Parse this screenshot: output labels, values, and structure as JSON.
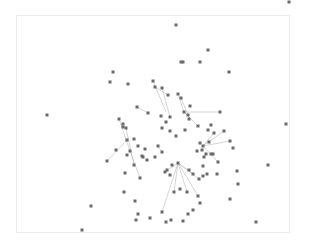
{
  "diagram": {
    "type": "network-graph",
    "frame": {
      "x": 16,
      "y": 15,
      "width": 273,
      "height": 217,
      "stroke": "#ececec"
    },
    "node_color": "#6a6a6a",
    "edge_color": "#b9b9b9",
    "node_size": 3,
    "nodes": [
      [
        176,
        25
      ],
      [
        208,
        50
      ],
      [
        289,
        2
      ],
      [
        200,
        62
      ],
      [
        229,
        72
      ],
      [
        181,
        62
      ],
      [
        183,
        62
      ],
      [
        113,
        72
      ],
      [
        110,
        82
      ],
      [
        128,
        84
      ],
      [
        220,
        112
      ],
      [
        47,
        115
      ],
      [
        286,
        124
      ],
      [
        137,
        107
      ],
      [
        153,
        81
      ],
      [
        155,
        87
      ],
      [
        162,
        88
      ],
      [
        168,
        95
      ],
      [
        178,
        94
      ],
      [
        181,
        98
      ],
      [
        190,
        106
      ],
      [
        148,
        113
      ],
      [
        161,
        116
      ],
      [
        166,
        122
      ],
      [
        189,
        119
      ],
      [
        184,
        112
      ],
      [
        170,
        117
      ],
      [
        188,
        115
      ],
      [
        119,
        119
      ],
      [
        123,
        127
      ],
      [
        126,
        128
      ],
      [
        127,
        140
      ],
      [
        130,
        151
      ],
      [
        134,
        139
      ],
      [
        127,
        155
      ],
      [
        123,
        124
      ],
      [
        116,
        150
      ],
      [
        107,
        161
      ],
      [
        125,
        173
      ],
      [
        142,
        156
      ],
      [
        138,
        146
      ],
      [
        145,
        149
      ],
      [
        143,
        157
      ],
      [
        134,
        165
      ],
      [
        147,
        160
      ],
      [
        155,
        157
      ],
      [
        162,
        152
      ],
      [
        158,
        146
      ],
      [
        162,
        128
      ],
      [
        170,
        131
      ],
      [
        176,
        136
      ],
      [
        185,
        130
      ],
      [
        198,
        126
      ],
      [
        208,
        130
      ],
      [
        211,
        125
      ],
      [
        214,
        133
      ],
      [
        224,
        131
      ],
      [
        230,
        141
      ],
      [
        233,
        148
      ],
      [
        209,
        142
      ],
      [
        200,
        143
      ],
      [
        203,
        146
      ],
      [
        202,
        150
      ],
      [
        206,
        154
      ],
      [
        211,
        154
      ],
      [
        213,
        154
      ],
      [
        204,
        157
      ],
      [
        197,
        151
      ],
      [
        218,
        162
      ],
      [
        203,
        166
      ],
      [
        207,
        174
      ],
      [
        203,
        176
      ],
      [
        178,
        163
      ],
      [
        172,
        165
      ],
      [
        167,
        170
      ],
      [
        165,
        172
      ],
      [
        170,
        175
      ],
      [
        189,
        170
      ],
      [
        193,
        174
      ],
      [
        199,
        179
      ],
      [
        198,
        196
      ],
      [
        174,
        192
      ],
      [
        187,
        192
      ],
      [
        200,
        203
      ],
      [
        193,
        210
      ],
      [
        188,
        214
      ],
      [
        183,
        221
      ],
      [
        217,
        174
      ],
      [
        237,
        171
      ],
      [
        238,
        184
      ],
      [
        230,
        199
      ],
      [
        268,
        165
      ],
      [
        256,
        222
      ],
      [
        135,
        201
      ],
      [
        138,
        214
      ],
      [
        136,
        220
      ],
      [
        150,
        218
      ],
      [
        162,
        212
      ],
      [
        166,
        222
      ],
      [
        171,
        220
      ],
      [
        180,
        189
      ],
      [
        140,
        178
      ],
      [
        124,
        192
      ],
      [
        91,
        206
      ],
      [
        82,
        230
      ]
    ],
    "edges": [
      [
        [
          153,
          81
        ],
        [
          166,
          112
        ]
      ],
      [
        [
          155,
          87
        ],
        [
          168,
          95
        ]
      ],
      [
        [
          162,
          88
        ],
        [
          170,
          117
        ]
      ],
      [
        [
          178,
          94
        ],
        [
          184,
          112
        ]
      ],
      [
        [
          181,
          98
        ],
        [
          188,
          115
        ]
      ],
      [
        [
          184,
          112
        ],
        [
          220,
          112
        ]
      ],
      [
        [
          184,
          112
        ],
        [
          198,
          126
        ]
      ],
      [
        [
          137,
          107
        ],
        [
          148,
          113
        ]
      ],
      [
        [
          119,
          119
        ],
        [
          130,
          151
        ]
      ],
      [
        [
          126,
          128
        ],
        [
          134,
          165
        ]
      ],
      [
        [
          127,
          140
        ],
        [
          107,
          161
        ]
      ],
      [
        [
          130,
          151
        ],
        [
          140,
          178
        ]
      ],
      [
        [
          203,
          146
        ],
        [
          230,
          141
        ]
      ],
      [
        [
          203,
          146
        ],
        [
          224,
          131
        ]
      ],
      [
        [
          203,
          146
        ],
        [
          214,
          133
        ]
      ],
      [
        [
          203,
          146
        ],
        [
          218,
          162
        ]
      ],
      [
        [
          178,
          163
        ],
        [
          165,
          172
        ]
      ],
      [
        [
          178,
          163
        ],
        [
          199,
          179
        ]
      ],
      [
        [
          178,
          163
        ],
        [
          187,
          192
        ]
      ],
      [
        [
          178,
          163
        ],
        [
          174,
          192
        ]
      ],
      [
        [
          178,
          163
        ],
        [
          162,
          212
        ]
      ],
      [
        [
          178,
          163
        ],
        [
          193,
          174
        ]
      ],
      [
        [
          178,
          163
        ],
        [
          198,
          196
        ]
      ],
      [
        [
          158,
          146
        ],
        [
          162,
          152
        ]
      ]
    ]
  }
}
